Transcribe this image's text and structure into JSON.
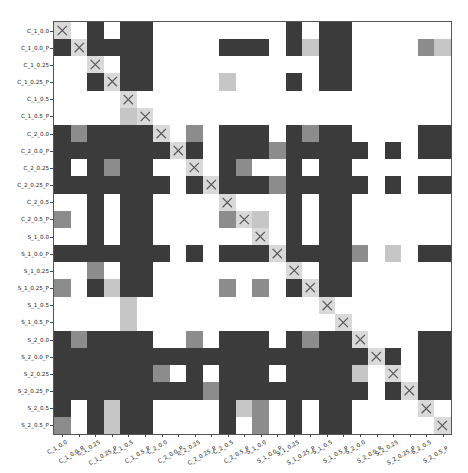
{
  "chart_data": {
    "type": "heatmap",
    "title": "",
    "xlabel": "",
    "ylabel": "",
    "legend": "none",
    "grid": false,
    "encoding": {
      "0": "white (no significant difference)",
      "1": "dark gray",
      "2": "medium gray",
      "3": "light gray",
      "9": "diagonal (self-comparison, marked X)"
    },
    "colors": {
      "0": "#ffffff",
      "1": "#3b3b3b",
      "2": "#8c8c8c",
      "3": "#c6c6c6",
      "9": "#d9d9d9",
      "x_mark": "#555555"
    },
    "labels": [
      "C_1_0.0",
      "C_1_0.0_P",
      "C_1_0.25",
      "C_1_0.25_P",
      "C_1_0.5",
      "C_1_0.5_P",
      "C_2_0.0",
      "C_2_0.0_P",
      "C_2_0.25",
      "C_2_0.25_P",
      "C_2_0.5",
      "C_2_0.5_P",
      "S_1_0.0",
      "S_1_0.0_P",
      "S_1_0.25",
      "S_1_0.25_P",
      "S_1_0.5",
      "S_1_0.5_P",
      "S_2_0.0",
      "S_2_0.0_P",
      "S_2_0.25",
      "S_2_0.25_P",
      "S_2_0.5",
      "S_2_0.5_P"
    ],
    "matrix": [
      [
        9,
        0,
        1,
        0,
        1,
        1,
        0,
        0,
        0,
        0,
        0,
        0,
        0,
        0,
        1,
        0,
        1,
        1,
        0,
        0,
        0,
        0,
        0,
        0
      ],
      [
        1,
        9,
        1,
        1,
        1,
        1,
        0,
        0,
        0,
        0,
        1,
        1,
        1,
        0,
        1,
        3,
        1,
        1,
        0,
        0,
        0,
        0,
        2,
        3
      ],
      [
        0,
        0,
        9,
        0,
        1,
        1,
        0,
        0,
        0,
        0,
        0,
        0,
        0,
        0,
        0,
        0,
        1,
        1,
        0,
        0,
        0,
        0,
        0,
        0
      ],
      [
        0,
        0,
        1,
        9,
        1,
        1,
        0,
        0,
        0,
        0,
        3,
        0,
        0,
        0,
        1,
        0,
        1,
        1,
        0,
        0,
        0,
        0,
        0,
        0
      ],
      [
        0,
        0,
        0,
        0,
        9,
        0,
        0,
        0,
        0,
        0,
        0,
        0,
        0,
        0,
        0,
        0,
        0,
        0,
        0,
        0,
        0,
        0,
        0,
        0
      ],
      [
        0,
        0,
        0,
        0,
        3,
        9,
        0,
        0,
        0,
        0,
        0,
        0,
        0,
        0,
        0,
        0,
        0,
        0,
        0,
        0,
        0,
        0,
        0,
        0
      ],
      [
        1,
        2,
        1,
        1,
        1,
        1,
        9,
        0,
        2,
        0,
        1,
        1,
        1,
        0,
        1,
        2,
        1,
        1,
        0,
        0,
        0,
        0,
        1,
        1
      ],
      [
        1,
        1,
        1,
        1,
        1,
        1,
        1,
        9,
        1,
        0,
        1,
        1,
        1,
        2,
        1,
        1,
        1,
        1,
        1,
        0,
        1,
        0,
        1,
        1
      ],
      [
        1,
        0,
        1,
        2,
        1,
        1,
        0,
        0,
        9,
        0,
        1,
        2,
        0,
        0,
        1,
        0,
        1,
        1,
        0,
        0,
        0,
        0,
        0,
        0
      ],
      [
        1,
        1,
        1,
        1,
        1,
        1,
        1,
        0,
        1,
        9,
        1,
        1,
        1,
        2,
        1,
        1,
        1,
        1,
        1,
        0,
        1,
        0,
        1,
        1
      ],
      [
        0,
        0,
        1,
        0,
        1,
        1,
        0,
        0,
        0,
        0,
        9,
        0,
        0,
        0,
        1,
        0,
        1,
        1,
        0,
        0,
        0,
        0,
        0,
        0
      ],
      [
        2,
        0,
        1,
        0,
        1,
        1,
        0,
        0,
        0,
        0,
        2,
        9,
        3,
        0,
        1,
        0,
        1,
        1,
        0,
        0,
        0,
        0,
        0,
        0
      ],
      [
        0,
        0,
        1,
        0,
        1,
        1,
        0,
        0,
        0,
        0,
        0,
        0,
        9,
        0,
        1,
        0,
        1,
        1,
        0,
        0,
        0,
        0,
        0,
        0
      ],
      [
        1,
        1,
        1,
        1,
        1,
        1,
        1,
        0,
        1,
        0,
        1,
        1,
        1,
        9,
        1,
        1,
        1,
        1,
        2,
        0,
        3,
        0,
        1,
        1
      ],
      [
        0,
        0,
        2,
        0,
        1,
        1,
        0,
        0,
        0,
        0,
        0,
        0,
        0,
        0,
        9,
        0,
        1,
        1,
        0,
        0,
        0,
        0,
        0,
        0
      ],
      [
        2,
        0,
        1,
        3,
        1,
        1,
        0,
        0,
        0,
        0,
        2,
        0,
        2,
        0,
        1,
        9,
        1,
        1,
        0,
        0,
        0,
        0,
        0,
        0
      ],
      [
        0,
        0,
        0,
        0,
        3,
        0,
        0,
        0,
        0,
        0,
        0,
        0,
        0,
        0,
        0,
        0,
        9,
        0,
        0,
        0,
        0,
        0,
        0,
        0
      ],
      [
        0,
        0,
        0,
        0,
        3,
        0,
        0,
        0,
        0,
        0,
        0,
        0,
        0,
        0,
        0,
        0,
        0,
        9,
        0,
        0,
        0,
        0,
        0,
        0
      ],
      [
        1,
        2,
        1,
        1,
        1,
        1,
        0,
        0,
        2,
        0,
        1,
        1,
        1,
        0,
        1,
        2,
        1,
        1,
        9,
        0,
        0,
        0,
        1,
        1
      ],
      [
        1,
        1,
        1,
        1,
        1,
        1,
        1,
        1,
        1,
        1,
        1,
        1,
        1,
        1,
        1,
        1,
        1,
        1,
        1,
        9,
        1,
        0,
        1,
        1
      ],
      [
        1,
        1,
        1,
        1,
        1,
        1,
        2,
        0,
        1,
        0,
        1,
        1,
        1,
        0,
        1,
        1,
        1,
        1,
        3,
        0,
        9,
        0,
        1,
        1
      ],
      [
        1,
        1,
        1,
        1,
        1,
        1,
        1,
        1,
        1,
        2,
        1,
        1,
        1,
        1,
        1,
        1,
        1,
        1,
        1,
        0,
        1,
        9,
        1,
        1
      ],
      [
        1,
        0,
        1,
        3,
        1,
        1,
        0,
        0,
        0,
        0,
        1,
        3,
        2,
        0,
        1,
        0,
        1,
        1,
        0,
        0,
        0,
        0,
        9,
        0
      ],
      [
        2,
        0,
        1,
        3,
        1,
        1,
        0,
        0,
        0,
        0,
        1,
        0,
        2,
        0,
        1,
        0,
        1,
        1,
        0,
        0,
        0,
        0,
        0,
        9
      ]
    ]
  }
}
